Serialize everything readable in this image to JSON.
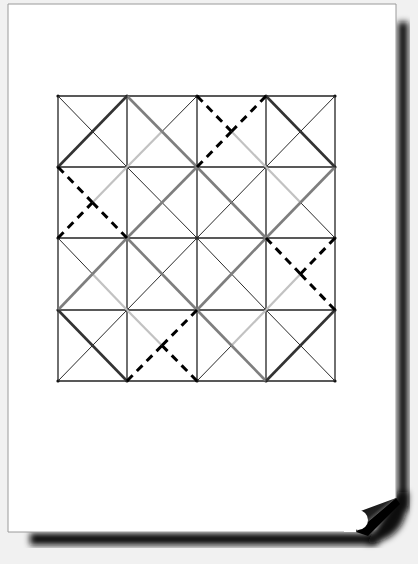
{
  "canvas": {
    "width": 418,
    "height": 564,
    "background": "#f1f1f1"
  },
  "page": {
    "left": 8,
    "top": 4,
    "right": 396,
    "bottom": 532,
    "fill": "#ffffff",
    "border": "#9a9a9a",
    "shadow_color": "#111111",
    "curl_corner": "bottom-right"
  },
  "grid": {
    "rows": 4,
    "cols": 4,
    "xs": [
      58,
      127,
      197,
      266,
      335
    ],
    "ys": [
      96,
      167,
      238,
      310,
      381
    ],
    "line_color": "#222222",
    "line_width": 1.3
  },
  "styles": {
    "thin": {
      "color": "#2a2a2a",
      "width": 1.0,
      "dash": ""
    },
    "dark": {
      "color": "#333333",
      "width": 2.6,
      "dash": ""
    },
    "medium": {
      "color": "#7e7e7e",
      "width": 2.6,
      "dash": ""
    },
    "light": {
      "color": "#c2c2c2",
      "width": 2.2,
      "dash": ""
    },
    "dashed": {
      "color": "#000000",
      "width": 3.0,
      "dash": "8,6"
    }
  },
  "cells": [
    [
      {
        "tl": "thin",
        "tr": "dark",
        "bl": "dark",
        "br": "thin"
      },
      {
        "tl": "medium",
        "tr": "thin",
        "bl": "light",
        "br": "medium"
      },
      {
        "tl": "dashed",
        "tr": "dashed",
        "bl": "dashed",
        "br": "light"
      },
      {
        "tl": "dark",
        "tr": "thin",
        "bl": "thin",
        "br": "dark"
      }
    ],
    [
      {
        "tl": "dashed",
        "tr": "light",
        "bl": "dashed",
        "br": "dashed"
      },
      {
        "tl": "thin",
        "tr": "medium",
        "bl": "medium",
        "br": "thin"
      },
      {
        "tl": "medium",
        "tr": "thin",
        "bl": "thin",
        "br": "medium"
      },
      {
        "tl": "light",
        "tr": "medium",
        "bl": "medium",
        "br": "thin"
      }
    ],
    [
      {
        "tl": "thin",
        "tr": "medium",
        "bl": "medium",
        "br": "light"
      },
      {
        "tl": "medium",
        "tr": "thin",
        "bl": "thin",
        "br": "medium"
      },
      {
        "tl": "thin",
        "tr": "medium",
        "bl": "medium",
        "br": "thin"
      },
      {
        "tl": "dashed",
        "tr": "dashed",
        "bl": "light",
        "br": "dashed"
      }
    ],
    [
      {
        "tl": "dark",
        "tr": "thin",
        "bl": "thin",
        "br": "dark"
      },
      {
        "tl": "light",
        "tr": "dashed",
        "bl": "dashed",
        "br": "dashed"
      },
      {
        "tl": "medium",
        "tr": "light",
        "bl": "thin",
        "br": "medium"
      },
      {
        "tl": "thin",
        "tr": "dark",
        "bl": "dark",
        "br": "thin"
      }
    ]
  ]
}
